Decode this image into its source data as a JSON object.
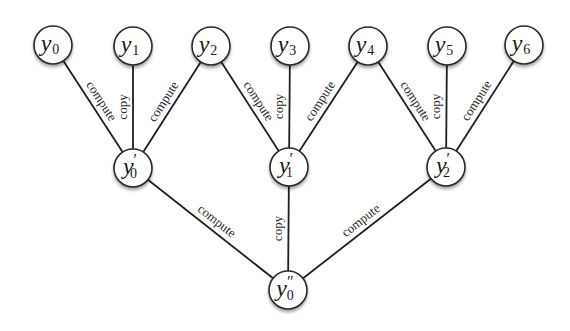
{
  "diagram": {
    "type": "tree",
    "nodes": [
      {
        "id": "y0",
        "base": "y",
        "sub": "0",
        "prime": "",
        "x": 53,
        "y": 45
      },
      {
        "id": "y1",
        "base": "y",
        "sub": "1",
        "prime": "",
        "x": 133,
        "y": 46
      },
      {
        "id": "y2",
        "base": "y",
        "sub": "2",
        "prime": "",
        "x": 211,
        "y": 46
      },
      {
        "id": "y3",
        "base": "y",
        "sub": "3",
        "prime": "",
        "x": 290,
        "y": 46
      },
      {
        "id": "y4",
        "base": "y",
        "sub": "4",
        "prime": "",
        "x": 368,
        "y": 46
      },
      {
        "id": "y5",
        "base": "y",
        "sub": "5",
        "prime": "",
        "x": 447,
        "y": 46
      },
      {
        "id": "y6",
        "base": "y",
        "sub": "6",
        "prime": "",
        "x": 524,
        "y": 45
      },
      {
        "id": "y0p",
        "base": "y",
        "sub": "0",
        "prime": "′",
        "x": 133,
        "y": 168
      },
      {
        "id": "y1p",
        "base": "y",
        "sub": "1",
        "prime": "′",
        "x": 289,
        "y": 167
      },
      {
        "id": "y2p",
        "base": "y",
        "sub": "2",
        "prime": "′",
        "x": 446,
        "y": 167
      },
      {
        "id": "y0pp",
        "base": "y",
        "sub": "0",
        "prime": "″",
        "x": 288,
        "y": 290
      }
    ],
    "edges": [
      {
        "from": "y0",
        "to": "y0p",
        "label": "compute"
      },
      {
        "from": "y1",
        "to": "y0p",
        "label": "copy"
      },
      {
        "from": "y2",
        "to": "y0p",
        "label": "compute"
      },
      {
        "from": "y2",
        "to": "y1p",
        "label": "compute"
      },
      {
        "from": "y3",
        "to": "y1p",
        "label": "copy"
      },
      {
        "from": "y4",
        "to": "y1p",
        "label": "compute"
      },
      {
        "from": "y4",
        "to": "y2p",
        "label": "compute"
      },
      {
        "from": "y5",
        "to": "y2p",
        "label": "copy"
      },
      {
        "from": "y6",
        "to": "y2p",
        "label": "compute"
      },
      {
        "from": "y0p",
        "to": "y0pp",
        "label": "compute"
      },
      {
        "from": "y1p",
        "to": "y0pp",
        "label": "copy"
      },
      {
        "from": "y2p",
        "to": "y0pp",
        "label": "compute"
      }
    ],
    "node_radius": 19,
    "colors": {
      "stroke": "#2a2a2a",
      "fill": "#ffffff",
      "text": "#1a1a1a"
    }
  }
}
